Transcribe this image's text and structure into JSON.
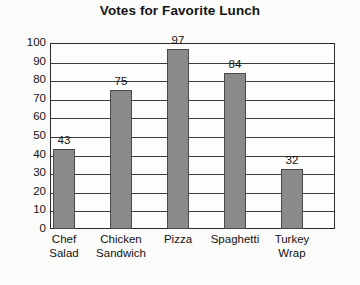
{
  "chart_data": {
    "type": "bar",
    "title": "Votes for Favorite Lunch",
    "xlabel": "",
    "ylabel": "",
    "categories": [
      "Chef Salad",
      "Chicken Sandwich",
      "Pizza",
      "Spaghetti",
      "Turkey Wrap"
    ],
    "values": [
      43,
      75,
      97,
      84,
      32
    ],
    "ylim": [
      0,
      100
    ],
    "ytick_step": 10,
    "yticks": [
      0,
      10,
      20,
      30,
      40,
      50,
      60,
      70,
      80,
      90,
      100
    ],
    "ytick_labels": [
      "0",
      "10",
      "20",
      "30",
      "40",
      "50",
      "60",
      "70",
      "80",
      "90",
      "100"
    ],
    "grid": true,
    "legend": false,
    "data_labels": [
      "43",
      "75",
      "97",
      "84",
      "32"
    ],
    "category_lines": [
      [
        "Chef",
        "Salad"
      ],
      [
        "Chicken",
        "Sandwich"
      ],
      [
        "Pizza"
      ],
      [
        "Spaghetti"
      ],
      [
        "Turkey",
        "Wrap"
      ]
    ],
    "colors": {
      "bar_fill": "#8a8a8a",
      "bar_border": "#4a4a4a",
      "axis": "#2b2b2b",
      "grid": "#3a3a3a",
      "text": "#141414",
      "background": "#fbfbfa",
      "plot_background": "#fdfdfc"
    }
  }
}
